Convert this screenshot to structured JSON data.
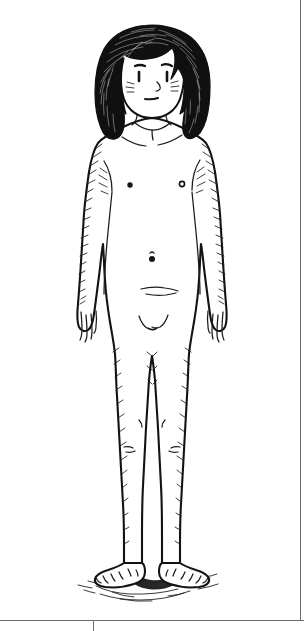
{
  "page": {
    "background_color": "#ffffff",
    "ink_color": "#131313",
    "width": 304,
    "height": 631
  },
  "illustration": {
    "name": "standing-figure",
    "style": "pen-and-ink line drawing with hatching",
    "subject": "full-body frontal standing human figure, nude, long wavy dark hair",
    "alt_text": "Black and white ink drawing of a person standing upright facing forward, arms at their sides, with long wavy dark hair and a hatched shadow beneath the feet."
  },
  "parts": {
    "hair": "long-wavy-dark-hair",
    "face": "face-with-eyes-nose-mouth-and-blush",
    "eyebrow_left": "left-eyebrow",
    "eyebrow_right": "right-eyebrow",
    "eye_left": "left-eye",
    "eye_right": "right-eye",
    "nose": "nose",
    "mouth": "mouth",
    "blush_left": "left-cheek-blush",
    "blush_right": "right-cheek-blush",
    "neck": "neck",
    "collarbone": "collarbone",
    "torso": "torso",
    "nipple_left": "left-nipple",
    "nipple_right": "right-nipple",
    "navel": "navel",
    "lower_abdomen": "lower-abdomen-crease",
    "groin": "groin",
    "arm_left": "left-arm",
    "arm_right": "right-arm",
    "hand_left": "left-hand",
    "hand_right": "right-hand",
    "leg_left": "left-leg",
    "leg_right": "right-leg",
    "knee_left": "left-knee",
    "knee_right": "right-knee",
    "foot_left": "left-foot",
    "foot_right": "right-foot",
    "ground_shadow": "ground-shadow"
  },
  "rules": {
    "bottom_rule": "bottom-horizontal-rule",
    "right_rule": "right-vertical-rule",
    "tick": "column-divider-tick",
    "color": "#6e6e6e"
  }
}
